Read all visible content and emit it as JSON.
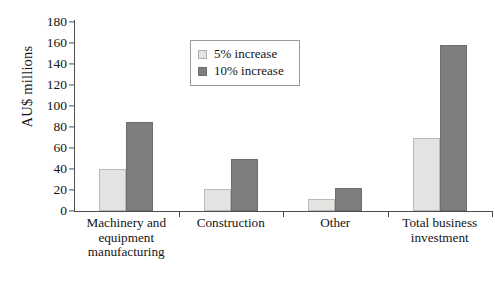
{
  "chart_data": {
    "type": "bar",
    "title": "",
    "xlabel": "",
    "ylabel": "AU$ millions",
    "ylim": [
      0,
      180
    ],
    "yticks": [
      0,
      20,
      40,
      60,
      80,
      100,
      120,
      140,
      160,
      180
    ],
    "grid": false,
    "legend_position": "top-center",
    "categories": [
      "Machinery and equipment manufacturing",
      "Construction",
      "Other",
      "Total business investment"
    ],
    "category_lines": [
      [
        "Machinery and",
        "equipment",
        "manufacturing"
      ],
      [
        "Construction"
      ],
      [
        "Other"
      ],
      [
        "Total business",
        "investment"
      ]
    ],
    "series": [
      {
        "name": "5% increase",
        "values": [
          40,
          21,
          11,
          70
        ],
        "color": "#e3e3e1"
      },
      {
        "name": "10% increase",
        "values": [
          85,
          50,
          22,
          158
        ],
        "color": "#7e7e7e"
      }
    ]
  },
  "legend": {
    "items": [
      {
        "label": "5% increase"
      },
      {
        "label": "10% increase"
      }
    ]
  }
}
